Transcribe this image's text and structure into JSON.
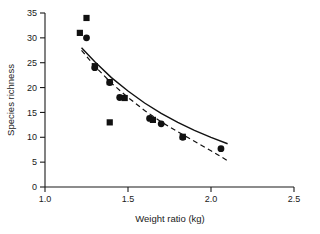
{
  "chart_data": {
    "type": "scatter",
    "title": "",
    "xlabel": "Weight ratio (kg)",
    "ylabel": "Species richness",
    "xlim": [
      1.0,
      2.5
    ],
    "ylim": [
      0,
      35
    ],
    "xticks": [
      1.0,
      1.5,
      2.0,
      2.5
    ],
    "xtick_labels": [
      "1.0",
      "1.5",
      "2.0",
      "2.5"
    ],
    "yticks": [
      0,
      5,
      10,
      15,
      20,
      25,
      30,
      35
    ],
    "ytick_labels": [
      "0",
      "5",
      "10",
      "15",
      "20",
      "25",
      "30",
      "35"
    ],
    "grid": false,
    "legend": "none",
    "marker_color": "#111111",
    "series": [
      {
        "name": "circles",
        "marker": "circle",
        "points": [
          {
            "x": 1.25,
            "y": 30.0
          },
          {
            "x": 1.3,
            "y": 24.0
          },
          {
            "x": 1.39,
            "y": 21.0
          },
          {
            "x": 1.45,
            "y": 18.0
          },
          {
            "x": 1.63,
            "y": 13.8
          },
          {
            "x": 1.7,
            "y": 12.7
          },
          {
            "x": 1.83,
            "y": 10.0
          },
          {
            "x": 2.06,
            "y": 7.7
          }
        ]
      },
      {
        "name": "squares",
        "marker": "square",
        "points": [
          {
            "x": 1.21,
            "y": 31.0
          },
          {
            "x": 1.25,
            "y": 34.0
          },
          {
            "x": 1.3,
            "y": 24.3
          },
          {
            "x": 1.39,
            "y": 21.1
          },
          {
            "x": 1.39,
            "y": 13.0
          },
          {
            "x": 1.48,
            "y": 17.9
          },
          {
            "x": 1.65,
            "y": 13.5
          },
          {
            "x": 1.83,
            "y": 10.1
          }
        ]
      }
    ],
    "curves": [
      {
        "name": "solid-fit-curve",
        "style": "solid",
        "points": [
          {
            "x": 1.22,
            "y": 28.0
          },
          {
            "x": 1.3,
            "y": 25.2
          },
          {
            "x": 1.4,
            "y": 22.0
          },
          {
            "x": 1.5,
            "y": 19.3
          },
          {
            "x": 1.6,
            "y": 16.9
          },
          {
            "x": 1.7,
            "y": 14.8
          },
          {
            "x": 1.8,
            "y": 13.0
          },
          {
            "x": 1.9,
            "y": 11.4
          },
          {
            "x": 2.0,
            "y": 10.0
          },
          {
            "x": 2.1,
            "y": 8.7
          }
        ]
      },
      {
        "name": "dashed-fit-curve",
        "style": "dashed",
        "points": [
          {
            "x": 1.22,
            "y": 27.5
          },
          {
            "x": 1.3,
            "y": 24.3
          },
          {
            "x": 1.4,
            "y": 20.9
          },
          {
            "x": 1.5,
            "y": 18.0
          },
          {
            "x": 1.6,
            "y": 15.4
          },
          {
            "x": 1.7,
            "y": 13.1
          },
          {
            "x": 1.8,
            "y": 11.1
          },
          {
            "x": 1.9,
            "y": 9.2
          },
          {
            "x": 2.0,
            "y": 7.3
          },
          {
            "x": 2.1,
            "y": 5.3
          }
        ]
      }
    ]
  }
}
